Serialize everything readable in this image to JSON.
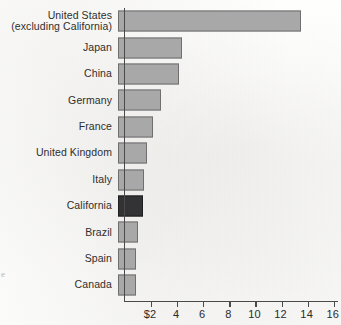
{
  "chart_data": {
    "type": "bar",
    "orientation": "horizontal",
    "title": "",
    "xlabel": "",
    "ylabel": "",
    "xlim": [
      0,
      16.4
    ],
    "grid": false,
    "legend": null,
    "axis_origin_label": "",
    "currency_prefix_on_first_tick": "$",
    "xticks": [
      2,
      4,
      6,
      8,
      10,
      12,
      14,
      16
    ],
    "xtick_labels": [
      "$2",
      "4",
      "6",
      "8",
      "10",
      "12",
      "14",
      "16"
    ],
    "categories": [
      "United States\n(excluding California)",
      "Japan",
      "China",
      "Germany",
      "France",
      "United Kingdom",
      "Italy",
      "California",
      "Brazil",
      "Spain",
      "Canada"
    ],
    "values": [
      14.0,
      4.9,
      4.7,
      3.3,
      2.7,
      2.2,
      2.0,
      1.95,
      1.5,
      1.4,
      1.35
    ],
    "highlight_category": "California",
    "colors": {
      "bar": "#a8a8a8",
      "bar_border": "#6f6f6f",
      "highlight_bar": "#333335",
      "highlight_bar_border": "#1f1f20",
      "axis": "#4a4a4a",
      "text": "#2e2e2e",
      "background": "#fdfdfc"
    }
  },
  "artifacts": {
    "margin_bleed_letter": "e"
  }
}
